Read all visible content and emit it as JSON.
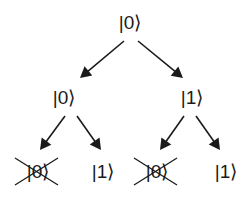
{
  "diagram": {
    "type": "binary-tree",
    "colors": {
      "ink": "#1a1a1a",
      "background": "#ffffff"
    },
    "nodes": [
      {
        "id": "root",
        "label": "|0⟩",
        "x": 130,
        "y": 22,
        "crossed": false
      },
      {
        "id": "l1-left",
        "label": "|0⟩",
        "x": 64,
        "y": 97,
        "crossed": false
      },
      {
        "id": "l1-right",
        "label": "|1⟩",
        "x": 192,
        "y": 97,
        "crossed": false
      },
      {
        "id": "l2-ll",
        "label": "|0⟩",
        "x": 38,
        "y": 171,
        "crossed": true
      },
      {
        "id": "l2-lr",
        "label": "|1⟩",
        "x": 103,
        "y": 171,
        "crossed": false
      },
      {
        "id": "l2-rl",
        "label": "|0⟩",
        "x": 157,
        "y": 171,
        "crossed": true
      },
      {
        "id": "l2-rr",
        "label": "|1⟩",
        "x": 226,
        "y": 171,
        "crossed": false
      }
    ],
    "edges": [
      {
        "from": "root",
        "to": "l1-left",
        "x1": 124,
        "y1": 41,
        "x2": 80,
        "y2": 78
      },
      {
        "from": "root",
        "to": "l1-right",
        "x1": 138,
        "y1": 41,
        "x2": 183,
        "y2": 78
      },
      {
        "from": "l1-left",
        "to": "l2-ll",
        "x1": 65,
        "y1": 116,
        "x2": 40,
        "y2": 150
      },
      {
        "from": "l1-left",
        "to": "l2-lr",
        "x1": 77,
        "y1": 116,
        "x2": 101,
        "y2": 150
      },
      {
        "from": "l1-right",
        "to": "l2-rl",
        "x1": 184,
        "y1": 116,
        "x2": 160,
        "y2": 150
      },
      {
        "from": "l1-right",
        "to": "l2-rr",
        "x1": 196,
        "y1": 116,
        "x2": 220,
        "y2": 150
      }
    ]
  }
}
